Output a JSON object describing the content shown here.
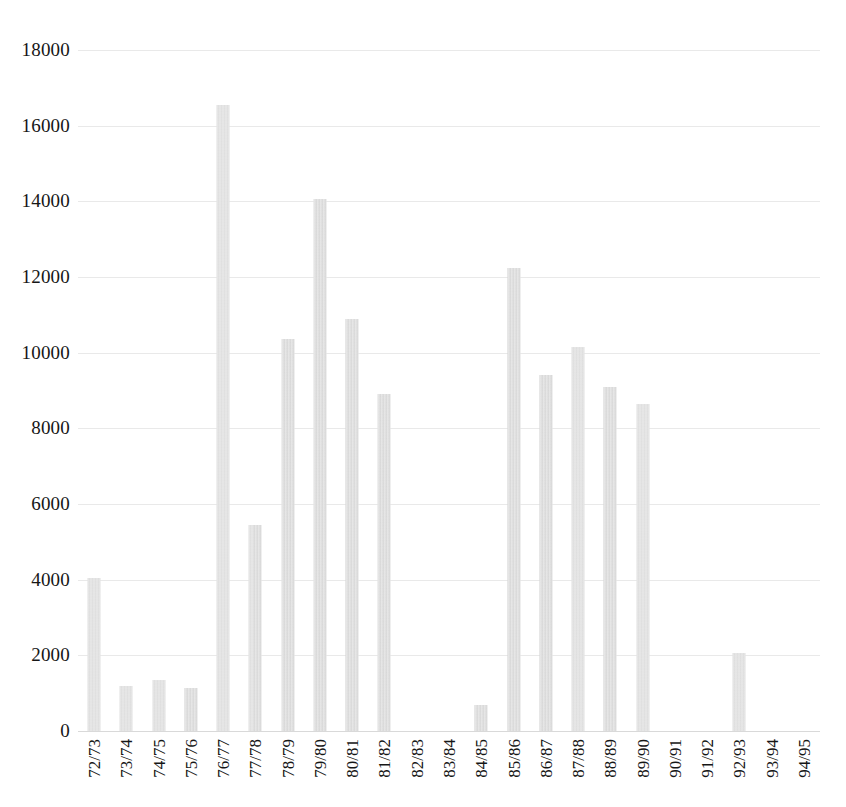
{
  "chart_data": {
    "type": "bar",
    "title": "",
    "subtitle": "",
    "xlabel": "",
    "ylabel": "",
    "ylim": [
      0,
      18000
    ],
    "ytick_step": 2000,
    "yticks": [
      "18000",
      "16000",
      "14000",
      "12000",
      "10000",
      "8000",
      "6000",
      "4000",
      "2000",
      "0"
    ],
    "grid": true,
    "grid_axis": "y",
    "legend": false,
    "legend_position": "none",
    "bar_color": "#dcdcdc",
    "categories": [
      "72/73",
      "73/74",
      "74/75",
      "75/76",
      "76/77",
      "77/78",
      "78/79",
      "79/80",
      "80/81",
      "81/82",
      "82/83",
      "83/84",
      "84/85",
      "85/86",
      "86/87",
      "87/88",
      "88/89",
      "89/90",
      "90/91",
      "91/92",
      "92/93",
      "93/94",
      "94/95"
    ],
    "values": [
      4050,
      1200,
      1350,
      1150,
      16550,
      5450,
      10350,
      14050,
      10900,
      8900,
      0,
      0,
      700,
      12250,
      9400,
      10150,
      9100,
      8650,
      0,
      0,
      2050,
      0,
      0
    ],
    "x_tick_rotation": -90
  }
}
